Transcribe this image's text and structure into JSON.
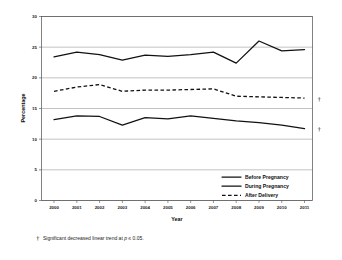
{
  "chart_data": {
    "type": "line",
    "title": "",
    "xlabel": "Year",
    "ylabel": "Percentage",
    "x": [
      2000,
      2001,
      2002,
      2003,
      2004,
      2005,
      2006,
      2007,
      2008,
      2009,
      2010,
      2011
    ],
    "xtick_labels": [
      "2000",
      "2001",
      "2002",
      "2003",
      "2004",
      "2005",
      "2006",
      "2007",
      "2008",
      "2009",
      "2010",
      "2011"
    ],
    "ytick_labels": [
      "0",
      "5",
      "10",
      "15",
      "20",
      "25",
      "30"
    ],
    "yticks": [
      0,
      5,
      10,
      15,
      20,
      25,
      30
    ],
    "ylim": [
      0,
      30
    ],
    "grid": "horizontal",
    "legend_position": "inside-lower-right",
    "series": [
      {
        "name": "Before Pregnancy",
        "style": "solid",
        "color": "#111111",
        "values": [
          23.4,
          24.2,
          23.8,
          22.9,
          23.7,
          23.5,
          23.8,
          24.2,
          22.4,
          26.0,
          24.4,
          24.6
        ],
        "significant_trend": false
      },
      {
        "name": "During Pregnancy",
        "style": "solid",
        "color": "#111111",
        "values": [
          13.2,
          13.8,
          13.7,
          12.3,
          13.5,
          13.3,
          13.8,
          13.4,
          13.0,
          12.7,
          12.3,
          11.7
        ],
        "significant_trend": true
      },
      {
        "name": "After Delivery",
        "style": "dashed",
        "color": "#111111",
        "values": [
          17.8,
          18.5,
          18.9,
          17.8,
          18.0,
          18.0,
          18.1,
          18.2,
          17.0,
          16.9,
          16.8,
          16.7
        ],
        "significant_trend": true
      }
    ],
    "annotations": [
      {
        "symbol": "†",
        "target_series": "After Delivery",
        "at_x": 2011
      },
      {
        "symbol": "†",
        "target_series": "During Pregnancy",
        "at_x": 2011
      }
    ]
  },
  "legend": {
    "items": [
      {
        "label": "Before Pregnancy",
        "style": "solid"
      },
      {
        "label": "During Pregnancy",
        "style": "solid"
      },
      {
        "label": "After Delivery",
        "style": "dashed"
      }
    ]
  },
  "footnote": {
    "symbol": "†",
    "text_before": "Significant decreased linear trend at ",
    "italic_part": "p",
    "text_after": " ≤ 0.05."
  }
}
